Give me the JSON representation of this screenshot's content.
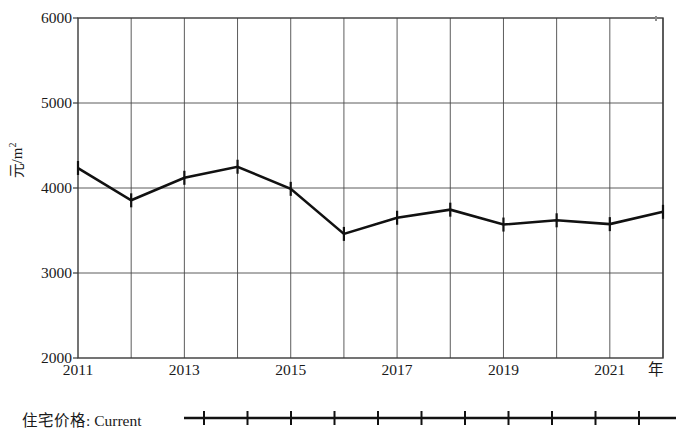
{
  "chart_data": {
    "type": "line",
    "title": "",
    "subtitle": "",
    "xlabel": "年",
    "ylabel": "元/m²",
    "x": [
      2011,
      2012,
      2013,
      2014,
      2015,
      2016,
      2017,
      2018,
      2019,
      2020,
      2021,
      2022
    ],
    "xtick_labels": [
      "2011",
      "2013",
      "2015",
      "2017",
      "2019",
      "2021"
    ],
    "xtick_values": [
      2011,
      2013,
      2015,
      2017,
      2019,
      2021
    ],
    "xlim": [
      2011,
      2022
    ],
    "ytick_labels": [
      "2000",
      "3000",
      "4000",
      "5000",
      "6000"
    ],
    "ytick_values": [
      2000,
      3000,
      4000,
      5000,
      6000
    ],
    "ylim": [
      2000,
      6000
    ],
    "grid": "both",
    "legend_position": "below",
    "series": [
      {
        "name": "住宅价格: Current",
        "marker": "vertical-tick",
        "color": "#111111",
        "values": [
          4235,
          3855,
          4120,
          4250,
          3990,
          3460,
          3650,
          3745,
          3570,
          3620,
          3575,
          3720
        ]
      }
    ]
  },
  "legend": {
    "entries": [
      {
        "label": "住宅价格: Current"
      }
    ]
  },
  "axis": {
    "y_unit_label_main": "元/m",
    "y_unit_label_sup": "2",
    "x_unit_label": "年"
  }
}
